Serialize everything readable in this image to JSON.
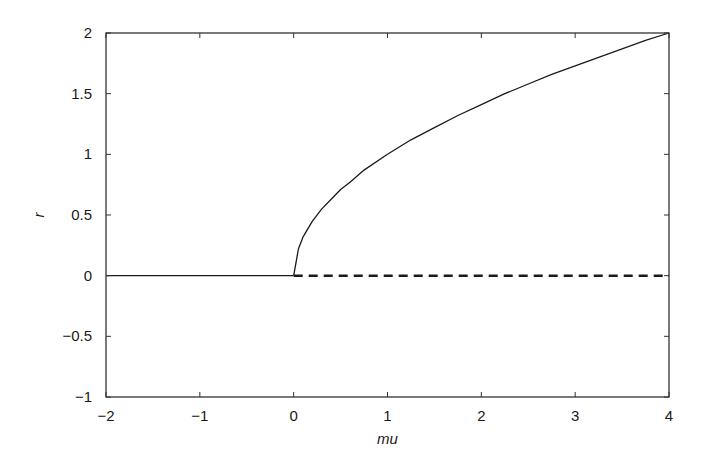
{
  "chart_data": {
    "type": "line",
    "title": "",
    "xlabel": "mu",
    "ylabel": "r",
    "xlim": [
      -2,
      4
    ],
    "ylim": [
      -1,
      2
    ],
    "grid": false,
    "legend": null,
    "x_ticks": [
      -2,
      -1,
      0,
      1,
      2,
      3,
      4
    ],
    "x_tick_labels": [
      "−2",
      "−1",
      "0",
      "1",
      "2",
      "3",
      "4"
    ],
    "y_ticks": [
      -1,
      -0.5,
      0,
      0.5,
      1,
      1.5,
      2
    ],
    "y_tick_labels": [
      "−1",
      "−0.5",
      "0",
      "0.5",
      "1",
      "1.5",
      "2"
    ],
    "series": [
      {
        "name": "stable r=0 (mu<0)",
        "style": "solid",
        "color": "#1a1a1a",
        "x": [
          -2,
          0
        ],
        "y": [
          0,
          0
        ]
      },
      {
        "name": "stable branch r=sqrt(mu)",
        "style": "solid",
        "color": "#1a1a1a",
        "x": [
          0,
          0.05,
          0.1,
          0.2,
          0.3,
          0.4,
          0.5,
          0.6,
          0.75,
          1.0,
          1.25,
          1.5,
          1.75,
          2.0,
          2.25,
          2.5,
          2.75,
          3.0,
          3.25,
          3.5,
          3.75,
          4.0
        ],
        "y": [
          0,
          0.22,
          0.32,
          0.45,
          0.55,
          0.63,
          0.71,
          0.77,
          0.87,
          1.0,
          1.12,
          1.22,
          1.32,
          1.41,
          1.5,
          1.58,
          1.66,
          1.73,
          1.8,
          1.87,
          1.94,
          2.0
        ]
      },
      {
        "name": "unstable r=0 (mu>0)",
        "style": "dashed",
        "color": "#1a1a1a",
        "x": [
          0,
          4
        ],
        "y": [
          0,
          0
        ]
      }
    ],
    "layout": {
      "plot_left": 106,
      "plot_top": 33,
      "plot_right": 669,
      "plot_bottom": 397
    }
  }
}
